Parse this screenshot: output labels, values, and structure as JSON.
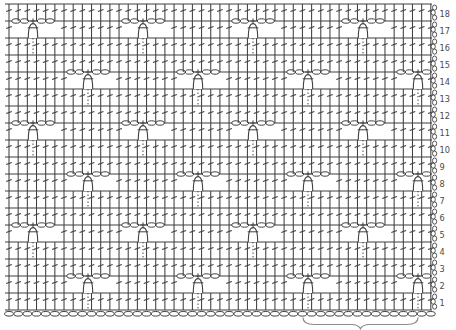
{
  "diagram": {
    "kind": "crochet-stitch-symbol-chart",
    "background_color": "#ffffff",
    "ink_color": "#3f3f3f",
    "number_color": "#4a4a4a",
    "brace_color": "#8c8c8c",
    "row_count": 18,
    "stitch_columns": 47,
    "row_numbers": [
      "1",
      "2",
      "3",
      "4",
      "5",
      "6",
      "7",
      "8",
      "9",
      "10",
      "11",
      "12",
      "13",
      "14",
      "15",
      "16",
      "17",
      "18"
    ],
    "symbols": {
      "plain_stitch": "double-crochet",
      "window_sequence": "chain, chain, single-crochet, chain, chain",
      "motif_stitch": "puff-stitch with dotted tail into row below",
      "foundation": "foundation-chain",
      "row_edge": "turning-chain x3"
    },
    "motif_rows": [
      {
        "row": 2,
        "puff_centers_px": [
          88,
          198,
          308,
          418
        ]
      },
      {
        "row": 5,
        "puff_centers_px": [
          33,
          143,
          253,
          363
        ]
      },
      {
        "row": 8,
        "puff_centers_px": [
          88,
          198,
          308,
          418
        ]
      },
      {
        "row": 11,
        "puff_centers_px": [
          33,
          143,
          253,
          363
        ]
      },
      {
        "row": 14,
        "puff_centers_px": [
          88,
          198,
          308,
          418
        ]
      },
      {
        "row": 17,
        "puff_centers_px": [
          33,
          143,
          253,
          363
        ]
      }
    ],
    "repeat_brace_px": {
      "x1": 303,
      "x2": 418
    }
  }
}
